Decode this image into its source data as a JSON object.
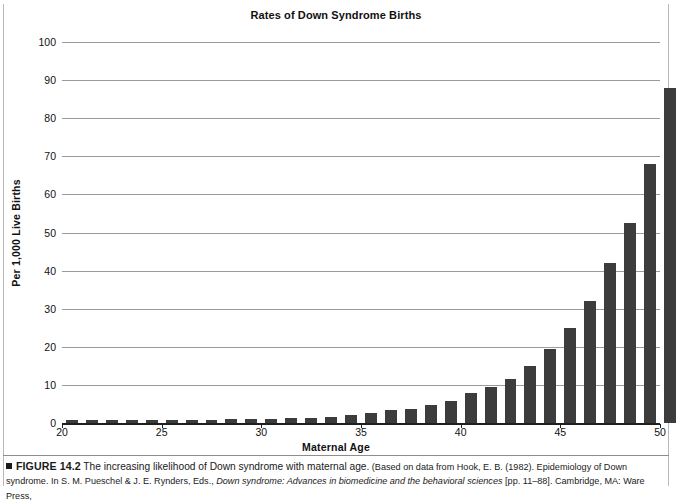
{
  "figure": {
    "title": "Rates of Down Syndrome Births",
    "number_label": "FIGURE 14.2",
    "lead_text": "The increasing likelihood of Down syndrome with maternal age.",
    "source_prefix": "(Based on data from Hook, E. B. (1982). Epidemiology of Down syndrome. In S. M. Pueschel & J. E. Rynders, Eds., ",
    "source_booktitle": "Down syndrome: Advances in biomedicine and the behavioral sciences",
    "source_suffix": " [pp. 11–88]. Cambridge, MA: Ware Press,"
  },
  "colors": {
    "bar": "#3c3c3c",
    "gridline": "#9b9b9b",
    "axis": "#1f1f1f",
    "background": "#ffffff",
    "text": "#1a1a1a"
  },
  "chart_data": {
    "type": "bar",
    "title": "Rates of Down Syndrome Births",
    "xlabel": "Maternal Age",
    "ylabel": "Per 1,000 Live Births",
    "xlim": [
      20,
      50
    ],
    "ylim": [
      0,
      100
    ],
    "ytick_labels": [
      "0",
      "10",
      "20",
      "30",
      "40",
      "50",
      "60",
      "70",
      "80",
      "90",
      "100"
    ],
    "yticks": [
      0,
      10,
      20,
      30,
      40,
      50,
      60,
      70,
      80,
      90,
      100
    ],
    "xtick_labels": [
      "20",
      "25",
      "30",
      "35",
      "40",
      "45",
      "50"
    ],
    "xticks": [
      20,
      25,
      30,
      35,
      40,
      45,
      50
    ],
    "grid": "horizontal",
    "legend": "none",
    "categories": [
      20,
      21,
      22,
      23,
      24,
      25,
      26,
      27,
      28,
      29,
      30,
      31,
      32,
      33,
      34,
      35,
      36,
      37,
      38,
      39,
      40,
      41,
      42,
      43,
      44,
      45,
      46,
      47,
      48,
      49
    ],
    "values": [
      0.7,
      0.7,
      0.7,
      0.8,
      0.8,
      0.9,
      0.9,
      0.9,
      1.0,
      1.0,
      1.1,
      1.2,
      1.4,
      1.6,
      2.2,
      2.7,
      3.3,
      3.8,
      4.6,
      5.8,
      7.8,
      9.5,
      11.5,
      15.0,
      19.5,
      25.0,
      32.0,
      42.0,
      52.5,
      68.0
    ],
    "values_note": "Rate of Down syndrome births per 1,000 live births by maternal age",
    "values_by_age": [
      {
        "age": 20,
        "rate": 0.7
      },
      {
        "age": 21,
        "rate": 0.7
      },
      {
        "age": 22,
        "rate": 0.7
      },
      {
        "age": 23,
        "rate": 0.8
      },
      {
        "age": 24,
        "rate": 0.8
      },
      {
        "age": 25,
        "rate": 0.9
      },
      {
        "age": 26,
        "rate": 0.9
      },
      {
        "age": 27,
        "rate": 0.9
      },
      {
        "age": 28,
        "rate": 1.0
      },
      {
        "age": 29,
        "rate": 1.0
      },
      {
        "age": 30,
        "rate": 1.1
      },
      {
        "age": 31,
        "rate": 1.2
      },
      {
        "age": 32,
        "rate": 1.4
      },
      {
        "age": 33,
        "rate": 1.6
      },
      {
        "age": 34,
        "rate": 2.2
      },
      {
        "age": 35,
        "rate": 2.7
      },
      {
        "age": 36,
        "rate": 3.3
      },
      {
        "age": 37,
        "rate": 3.8
      },
      {
        "age": 38,
        "rate": 4.6
      },
      {
        "age": 39,
        "rate": 5.8
      },
      {
        "age": 40,
        "rate": 7.8
      },
      {
        "age": 41,
        "rate": 9.5
      },
      {
        "age": 42,
        "rate": 11.5
      },
      {
        "age": 43,
        "rate": 15.0
      },
      {
        "age": 44,
        "rate": 19.5
      },
      {
        "age": 45,
        "rate": 25.0
      },
      {
        "age": 46,
        "rate": 32.0
      },
      {
        "age": 47,
        "rate": 42.0
      },
      {
        "age": 48,
        "rate": 52.5
      },
      {
        "age": 49,
        "rate": 68.0
      },
      {
        "age": 50,
        "rate": 88.0
      }
    ]
  }
}
